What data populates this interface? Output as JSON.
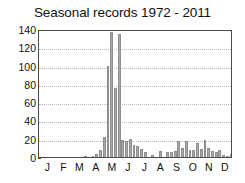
{
  "chart_data": {
    "type": "bar",
    "title": "Seasonal records 1972 - 2011",
    "xlabel": "",
    "ylabel": "",
    "ylim": [
      0,
      140
    ],
    "yticks": [
      0,
      20,
      40,
      60,
      80,
      100,
      120,
      140
    ],
    "ytick_labels": [
      "0",
      "20",
      "40",
      "60",
      "80",
      "100",
      "120",
      "140"
    ],
    "grid": "horizontal-dotted",
    "legend": "none",
    "bar_color": "#a8a8a8",
    "bar_edge_color": "#8f8f8f",
    "month_labels": [
      "J",
      "F",
      "M",
      "A",
      "M",
      "J",
      "J",
      "A",
      "S",
      "O",
      "N",
      "D"
    ],
    "month_label_positions": [
      2.0,
      6.3,
      10.6,
      15.0,
      19.3,
      23.6,
      28.0,
      32.3,
      36.6,
      41.0,
      45.3,
      49.6
    ],
    "x_bin_count": 52,
    "x_bin_note": "weekly bins across the calendar year",
    "categories": [
      1,
      2,
      3,
      4,
      5,
      6,
      7,
      8,
      9,
      10,
      11,
      12,
      13,
      14,
      15,
      16,
      17,
      18,
      19,
      20,
      21,
      22,
      23,
      24,
      25,
      26,
      27,
      28,
      29,
      30,
      31,
      32,
      33,
      34,
      35,
      36,
      37,
      38,
      39,
      40,
      41,
      42,
      43,
      44,
      45,
      46,
      47,
      48,
      49,
      50,
      51,
      52
    ],
    "values": [
      0,
      0,
      0,
      0,
      0,
      0,
      0,
      0,
      0,
      0,
      0,
      0,
      1,
      0,
      1,
      3,
      8,
      22,
      100,
      137,
      76,
      135,
      19,
      18,
      20,
      13,
      12,
      9,
      5,
      0,
      2,
      0,
      7,
      0,
      5,
      5,
      7,
      17,
      10,
      18,
      8,
      8,
      15,
      9,
      19,
      10,
      7,
      6,
      8,
      2,
      1,
      3
    ]
  }
}
